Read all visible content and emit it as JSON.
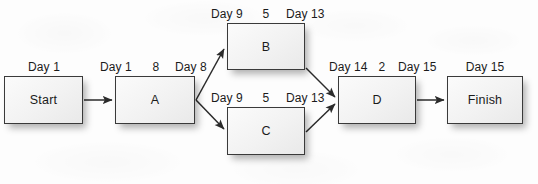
{
  "diagram": {
    "type": "project-network-diagram",
    "nodes": [
      {
        "id": "start",
        "label": "Start",
        "start_label": "Day 1",
        "duration": "",
        "finish_label": "",
        "x": 4,
        "y": 76,
        "w": 79,
        "h": 48
      },
      {
        "id": "a",
        "label": "A",
        "start_label": "Day 1",
        "duration": "8",
        "finish_label": "Day 8",
        "x": 115,
        "y": 76,
        "w": 80,
        "h": 48
      },
      {
        "id": "b",
        "label": "B",
        "start_label": "Day 9",
        "duration": "5",
        "finish_label": "Day 13",
        "x": 227,
        "y": 23,
        "w": 78,
        "h": 47
      },
      {
        "id": "c",
        "label": "C",
        "start_label": "Day 9",
        "duration": "5",
        "finish_label": "Day 13",
        "x": 227,
        "y": 107,
        "w": 78,
        "h": 48
      },
      {
        "id": "d",
        "label": "D",
        "start_label": "Day 14",
        "duration": "2",
        "finish_label": "Day 15",
        "x": 338,
        "y": 76,
        "w": 78,
        "h": 48
      },
      {
        "id": "finish",
        "label": "Finish",
        "start_label": "Day 15",
        "duration": "",
        "finish_label": "",
        "x": 447,
        "y": 76,
        "w": 76,
        "h": 48
      }
    ],
    "edges": [
      {
        "from": "start",
        "to": "a",
        "kind": "straight"
      },
      {
        "from": "a",
        "to": "b",
        "kind": "diagonal-up"
      },
      {
        "from": "a",
        "to": "c",
        "kind": "diagonal-down"
      },
      {
        "from": "b",
        "to": "d",
        "kind": "diagonal-down"
      },
      {
        "from": "c",
        "to": "d",
        "kind": "diagonal-up"
      },
      {
        "from": "d",
        "to": "finish",
        "kind": "straight"
      }
    ],
    "colors": {
      "background": "#fdfdfd",
      "box_border": "#3a3a3a",
      "box_fill": "#f4f4f4",
      "text": "#1b1b1b",
      "arrow": "#2b2b2b"
    }
  }
}
